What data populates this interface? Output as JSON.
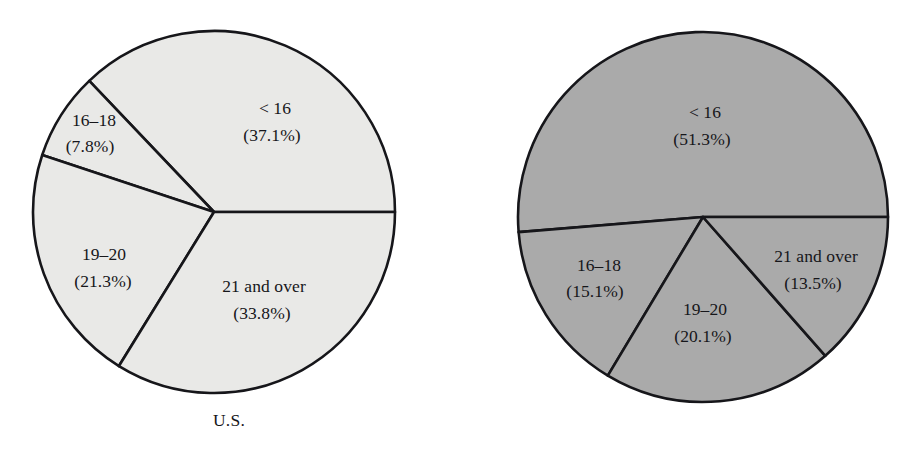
{
  "figure": {
    "background_color": "#ffffff",
    "outline_color": "#16161a"
  },
  "charts": [
    {
      "id": "us",
      "caption": "U.S.",
      "fill_color": "#e9e9e7",
      "center_x": 214,
      "center_y": 212,
      "radius": 181,
      "start_angle_deg": 0,
      "slices": [
        {
          "label": "< 16",
          "percent_text": "(37.1%)",
          "value": 37.1,
          "label_x": 275,
          "label_y": 110,
          "label_x2": 272,
          "label_y2": 137
        },
        {
          "label": "16–18",
          "percent_text": "(7.8%)",
          "value": 7.8,
          "label_x": 94,
          "label_y": 122,
          "label_x2": 90,
          "label_y2": 148
        },
        {
          "label": "19–20",
          "percent_text": "(21.3%)",
          "value": 21.3,
          "label_x": 104,
          "label_y": 256,
          "label_x2": 103,
          "label_y2": 283
        },
        {
          "label": "21 and over",
          "percent_text": "(33.8%)",
          "value": 33.8,
          "label_x": 264,
          "label_y": 288,
          "label_x2": 262,
          "label_y2": 315
        }
      ]
    },
    {
      "id": "state",
      "caption": "State",
      "fill_color": "#aaaaaa",
      "center_x": 244,
      "center_y": 217,
      "radius": 185,
      "start_angle_deg": 0,
      "slices": [
        {
          "label": "< 16",
          "percent_text": "(51.3%)",
          "value": 51.3,
          "label_x": 246,
          "label_y": 114,
          "label_x2": 243,
          "label_y2": 141
        },
        {
          "label": "16–18",
          "percent_text": "(15.1%)",
          "value": 15.1,
          "label_x": 140,
          "label_y": 267,
          "label_x2": 136,
          "label_y2": 293
        },
        {
          "label": "19–20",
          "percent_text": "(20.1%)",
          "value": 20.1,
          "label_x": 246,
          "label_y": 311,
          "label_x2": 244,
          "label_y2": 338
        },
        {
          "label": "21 and over",
          "percent_text": "(13.5%)",
          "value": 13.5,
          "label_x": 357,
          "label_y": 258,
          "label_x2": 354,
          "label_y2": 285
        }
      ]
    }
  ],
  "chart_data": [
    {
      "type": "pie",
      "title": "U.S.",
      "categories": [
        "< 16",
        "16–18",
        "19–20",
        "21 and over"
      ],
      "values": [
        37.1,
        7.8,
        21.3,
        33.8
      ],
      "value_labels": [
        "(37.1%)",
        "(7.8%)",
        "(21.3%)",
        "(33.8%)"
      ],
      "unit": "percent",
      "slice_fill": "#e9e9e7",
      "start_angle_deg": 0,
      "direction": "counterclockwise",
      "legend": "none",
      "labels_position": "inside-and-outside-slices"
    },
    {
      "type": "pie",
      "title": "State",
      "categories": [
        "< 16",
        "16–18",
        "19–20",
        "21 and over"
      ],
      "values": [
        51.3,
        15.1,
        20.1,
        13.5
      ],
      "value_labels": [
        "(51.3%)",
        "(15.1%)",
        "(20.1%)",
        "(13.5%)"
      ],
      "unit": "percent",
      "slice_fill": "#aaaaaa",
      "start_angle_deg": 0,
      "direction": "counterclockwise",
      "legend": "none",
      "labels_position": "inside-slices"
    }
  ]
}
